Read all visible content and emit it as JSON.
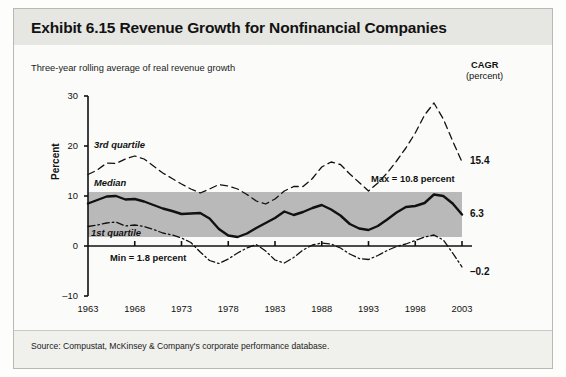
{
  "figure": {
    "title": "Exhibit 6.15 Revenue Growth for Nonfinancial Companies",
    "subtitle": "Three-year rolling average of real revenue growth",
    "source": "Source: Compustat, McKinsey & Company's corporate performance database.",
    "cagr_header": "CAGR",
    "cagr_unit": "(percent)"
  },
  "annotations": {
    "third_quartile": "3rd quartile",
    "median": "Median",
    "first_quartile": "1st quartile",
    "max": "Max = 10.8 percent",
    "min": "Min = 1.8 percent"
  },
  "cagr_values": {
    "third_quartile": "15.4",
    "median": "6.3",
    "first_quartile": "–0.2"
  },
  "chart_data": {
    "type": "line",
    "title": "Exhibit 6.15 Revenue Growth for Nonfinancial Companies",
    "subtitle": "Three-year rolling average of real revenue growth",
    "xlabel": "",
    "ylabel": "Percent",
    "ylim": [
      -10,
      30
    ],
    "yticks": [
      -10,
      0,
      10,
      20,
      30
    ],
    "ytick_labels": [
      "–10",
      "0",
      "10",
      "20",
      "30"
    ],
    "xlim": [
      1963,
      2003
    ],
    "xticks": [
      1963,
      1968,
      1973,
      1978,
      1983,
      1988,
      1993,
      1998,
      2003
    ],
    "xtick_labels": [
      "1963",
      "1968",
      "1973",
      "1978",
      "1983",
      "1988",
      "1993",
      "1998",
      "2003"
    ],
    "grid": false,
    "legend": "inline-labels",
    "band": {
      "label": "median range band",
      "y_top": 10.8,
      "y_bottom": 1.8,
      "color": "#b3b3b3",
      "note_top": "Max = 10.8 percent",
      "note_bottom": "Min = 1.8 percent"
    },
    "x": [
      1963,
      1964,
      1965,
      1966,
      1967,
      1968,
      1969,
      1970,
      1971,
      1972,
      1973,
      1974,
      1975,
      1976,
      1977,
      1978,
      1979,
      1980,
      1981,
      1982,
      1983,
      1984,
      1985,
      1986,
      1987,
      1988,
      1989,
      1990,
      1991,
      1992,
      1993,
      1994,
      1995,
      1996,
      1997,
      1998,
      1999,
      2000,
      2001,
      2002,
      2003
    ],
    "series": [
      {
        "name": "3rd quartile",
        "style": "dashed",
        "cagr": 15.4,
        "values": [
          14.3,
          15.2,
          16.6,
          16.5,
          17.4,
          18.0,
          17.4,
          16.0,
          14.6,
          13.5,
          12.4,
          11.4,
          10.6,
          11.4,
          12.3,
          12.0,
          11.4,
          10.3,
          9.0,
          8.4,
          9.4,
          11.0,
          11.9,
          11.9,
          13.5,
          15.8,
          16.8,
          16.3,
          14.4,
          12.7,
          11.0,
          12.6,
          14.6,
          17.0,
          19.6,
          22.6,
          26.2,
          28.6,
          25.4,
          21.0,
          16.8
        ]
      },
      {
        "name": "Median",
        "style": "solid",
        "cagr": 6.3,
        "values": [
          8.5,
          9.2,
          9.9,
          10.0,
          9.3,
          9.4,
          8.9,
          8.2,
          7.5,
          7.0,
          6.4,
          6.5,
          6.6,
          5.5,
          3.4,
          2.1,
          1.8,
          2.5,
          3.6,
          4.6,
          5.6,
          6.9,
          6.2,
          6.8,
          7.6,
          8.2,
          7.3,
          6.1,
          4.4,
          3.5,
          3.2,
          4.0,
          5.3,
          6.7,
          7.8,
          8.0,
          8.6,
          10.3,
          10.0,
          8.5,
          6.3
        ]
      },
      {
        "name": "1st quartile",
        "style": "dash-dot",
        "cagr": -0.2,
        "values": [
          3.9,
          4.2,
          4.6,
          4.8,
          4.0,
          4.2,
          3.9,
          3.3,
          2.6,
          2.2,
          1.6,
          0.7,
          -1.2,
          -2.9,
          -3.5,
          -2.6,
          -1.4,
          -0.4,
          0.3,
          -1.0,
          -2.8,
          -3.4,
          -2.3,
          -0.8,
          0.2,
          0.6,
          0.4,
          -0.4,
          -1.6,
          -2.5,
          -2.7,
          -1.9,
          -0.9,
          -0.1,
          0.4,
          1.1,
          1.8,
          2.2,
          1.2,
          -1.4,
          -4.2
        ]
      }
    ]
  }
}
